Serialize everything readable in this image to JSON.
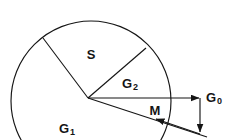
{
  "figure": {
    "type": "geometric-sector-diagram",
    "background_color": "#ffffff",
    "stroke_color": "#151515",
    "canvas": {
      "width": 226,
      "height": 140
    },
    "circle": {
      "cx": 91,
      "cy": 101,
      "r": 80
    },
    "vertex": {
      "x": 88,
      "y": 98
    },
    "labels": {
      "sector_s": "S",
      "sector_g2_base": "G",
      "sector_g2_sub": "2",
      "sector_g1_base": "G",
      "sector_g1_sub": "1",
      "vector_g0_base": "G",
      "vector_g0_sub": "0",
      "vector_m": "M"
    },
    "label_positions": {
      "sector_s": {
        "x": 91,
        "y": 56
      },
      "sector_g2": {
        "x": 131,
        "y": 85
      },
      "sector_g1": {
        "x": 68,
        "y": 130
      },
      "vector_g0": {
        "x": 208,
        "y": 99
      },
      "vector_m": {
        "x": 155,
        "y": 112
      }
    },
    "radii": [
      {
        "name": "radius-s-g1-boundary",
        "x1": 88,
        "y1": 98,
        "x2": 43,
        "y2": 38
      },
      {
        "name": "radius-s-g2-boundary",
        "x1": 88,
        "y1": 98,
        "x2": 146,
        "y2": 48
      }
    ],
    "vectors": [
      {
        "name": "vector-g0",
        "x1": 88,
        "y1": 98,
        "x2": 200,
        "y2": 98,
        "arrow": "end"
      },
      {
        "name": "vector-m",
        "x1": 88,
        "y1": 98,
        "x2": 206,
        "y2": 136,
        "arrow": "mid-back"
      },
      {
        "name": "vector-component",
        "x1": 200,
        "y1": 98,
        "x2": 200,
        "y2": 133,
        "arrow": "end"
      },
      {
        "name": "vector-resultant-tail",
        "x1": 206,
        "y1": 136,
        "x2": 155,
        "y2": 119,
        "arrow": "end"
      }
    ]
  }
}
